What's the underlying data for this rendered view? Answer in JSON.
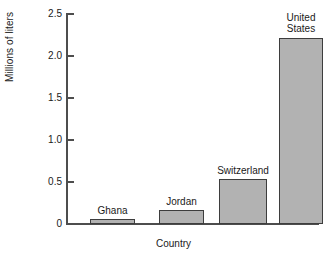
{
  "chart_data": {
    "type": "bar",
    "title": "",
    "subtitle": "",
    "xlabel": "Country",
    "ylabel": "Millions of liters",
    "categories": [
      "Ghana",
      "Jordan",
      "Switzerland",
      "United States"
    ],
    "values": [
      0.06,
      0.17,
      0.53,
      2.22
    ],
    "series": [
      {
        "name": "Millions of liters",
        "values": [
          0.06,
          0.17,
          0.53,
          2.22
        ]
      }
    ],
    "ylim": [
      0,
      2.5
    ],
    "yticks": [
      0,
      0.5,
      1.0,
      1.5,
      2.0,
      2.5
    ],
    "ytick_labels": [
      "0",
      "0.5",
      "1.0",
      "1.5",
      "2.0",
      "2.5"
    ],
    "grid": false,
    "legend": false,
    "legend_position": "none",
    "bar_labels_position": "above-bar",
    "annotations": [],
    "colors": {
      "bar_fill": "#b2b2b2",
      "bar_border": "#3d3d3d",
      "axis": "#4d4d4d",
      "text": "#1a1a1a",
      "background": "#ffffff"
    }
  },
  "bars": [
    {
      "label": "Ghana",
      "value": 0.06
    },
    {
      "label": "Jordan",
      "value": 0.17
    },
    {
      "label": "Switzerland",
      "value": 0.53
    },
    {
      "label": "United\nStates",
      "value": 2.22
    }
  ],
  "yticks": [
    {
      "label": "2.5",
      "value": 2.5
    },
    {
      "label": "2.0",
      "value": 2.0
    },
    {
      "label": "1.5",
      "value": 1.5
    },
    {
      "label": "1.0",
      "value": 1.0
    },
    {
      "label": "0.5",
      "value": 0.5
    },
    {
      "label": "0",
      "value": 0
    }
  ],
  "axes": {
    "y_title": "Millions of liters",
    "x_title": "Country"
  }
}
